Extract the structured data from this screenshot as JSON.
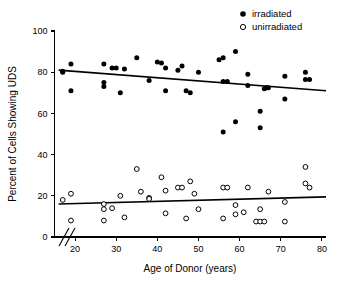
{
  "chart_data": {
    "type": "scatter",
    "title": "",
    "xlabel": "Age of Donor (years)",
    "ylabel": "Percent of Cells Showing UDS",
    "xlim": [
      15,
      81
    ],
    "ylim": [
      0,
      100
    ],
    "xticks": [
      20,
      30,
      40,
      50,
      60,
      70,
      80
    ],
    "yticks": [
      0,
      20,
      40,
      60,
      80,
      100
    ],
    "xtick_labels": [
      "20",
      "30",
      "40",
      "50",
      "60",
      "70",
      "80"
    ],
    "ytick_labels": [
      "0",
      "20",
      "40",
      "60",
      "80",
      "100"
    ],
    "grid": false,
    "axis_break_x": true,
    "axis_break_y": true,
    "legend_position": "top-right",
    "series": [
      {
        "name": "irradiated",
        "marker": "filled-circle",
        "color": "#000000",
        "points": [
          [
            17,
            80
          ],
          [
            17,
            80.5
          ],
          [
            19,
            84
          ],
          [
            19,
            71
          ],
          [
            27,
            84
          ],
          [
            27,
            75
          ],
          [
            27,
            73
          ],
          [
            29,
            82
          ],
          [
            30,
            82
          ],
          [
            31,
            70
          ],
          [
            32,
            81.5
          ],
          [
            35,
            87
          ],
          [
            38,
            76
          ],
          [
            40,
            85
          ],
          [
            41,
            84.5
          ],
          [
            42,
            82
          ],
          [
            42,
            71
          ],
          [
            45,
            81
          ],
          [
            46,
            83
          ],
          [
            47,
            71
          ],
          [
            48,
            70
          ],
          [
            50,
            80
          ],
          [
            55,
            86
          ],
          [
            56,
            87
          ],
          [
            56,
            75.5
          ],
          [
            57,
            75.5
          ],
          [
            56,
            51
          ],
          [
            59,
            90
          ],
          [
            59,
            56
          ],
          [
            62,
            79
          ],
          [
            62,
            73.5
          ],
          [
            65,
            61
          ],
          [
            65,
            53
          ],
          [
            66,
            72
          ],
          [
            66.5,
            72.5
          ],
          [
            67,
            72.5
          ],
          [
            71,
            78
          ],
          [
            71,
            67
          ],
          [
            76,
            80
          ],
          [
            76,
            76.5
          ],
          [
            77,
            76.5
          ]
        ],
        "fit_line": {
          "x1": 16,
          "y1": 81,
          "x2": 81,
          "y2": 71
        }
      },
      {
        "name": "unirradiated",
        "marker": "open-circle",
        "color": "#000000",
        "points": [
          [
            17,
            18
          ],
          [
            19,
            21
          ],
          [
            19,
            8
          ],
          [
            27,
            16
          ],
          [
            27,
            13.5
          ],
          [
            27,
            8
          ],
          [
            29,
            14
          ],
          [
            31,
            20
          ],
          [
            32,
            9.5
          ],
          [
            35,
            33
          ],
          [
            36,
            22
          ],
          [
            38,
            19
          ],
          [
            38,
            18.5
          ],
          [
            41,
            29
          ],
          [
            42,
            22.5
          ],
          [
            42,
            11.5
          ],
          [
            45,
            24
          ],
          [
            46,
            24
          ],
          [
            47,
            9
          ],
          [
            48,
            27
          ],
          [
            49,
            21
          ],
          [
            50,
            13.5
          ],
          [
            56,
            9
          ],
          [
            56,
            24
          ],
          [
            57,
            24
          ],
          [
            59,
            11
          ],
          [
            59,
            15.5
          ],
          [
            61,
            12
          ],
          [
            62,
            24
          ],
          [
            64,
            7.5
          ],
          [
            65,
            7.5
          ],
          [
            65,
            13.5
          ],
          [
            66,
            7.5
          ],
          [
            67,
            22
          ],
          [
            71,
            17
          ],
          [
            71,
            7.5
          ],
          [
            76,
            34
          ],
          [
            76,
            26
          ],
          [
            77,
            24
          ]
        ],
        "fit_line": {
          "x1": 16,
          "y1": 16,
          "x2": 81,
          "y2": 19.5
        }
      }
    ],
    "legend": [
      {
        "label": "irradiated",
        "marker": "filled-circle"
      },
      {
        "label": "unirradiated",
        "marker": "open-circle"
      }
    ]
  }
}
